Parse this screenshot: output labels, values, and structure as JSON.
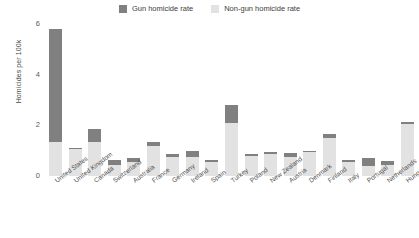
{
  "chart_data": {
    "type": "bar",
    "title": "",
    "subtitle": "",
    "xlabel": "",
    "ylabel": "Homicides per 100k",
    "ylim": [
      0,
      6
    ],
    "yticks": [
      0,
      2,
      4,
      6
    ],
    "grid": false,
    "stacked": true,
    "legend_position": "top-center",
    "categories": [
      "United States",
      "United Kingdom",
      "Canada",
      "Switzerland",
      "Australia",
      "France",
      "Germany",
      "Ireland",
      "Spain",
      "Turkey",
      "Poland",
      "New Zealand",
      "Austria",
      "Denmark",
      "Finland",
      "Italy",
      "Portugal",
      "Netherlands",
      "Hungary"
    ],
    "series": [
      {
        "name": "Gun homicide rate",
        "color": "#808080",
        "values": [
          4.45,
          0.05,
          0.5,
          0.2,
          0.15,
          0.15,
          0.1,
          0.25,
          0.1,
          0.7,
          0.05,
          0.1,
          0.15,
          0.05,
          0.15,
          0.1,
          0.3,
          0.15,
          0.1
        ]
      },
      {
        "name": "Non-gun homicide rate",
        "color": "#e2e2e2",
        "values": [
          1.35,
          1.05,
          1.35,
          0.45,
          0.55,
          1.2,
          0.75,
          0.75,
          0.55,
          2.1,
          0.8,
          0.85,
          0.75,
          0.95,
          1.5,
          0.55,
          0.4,
          0.45,
          2.05
        ]
      }
    ],
    "totals": [
      5.8,
      1.1,
      1.85,
      0.65,
      0.7,
      1.35,
      0.85,
      1.0,
      0.65,
      2.8,
      0.85,
      0.95,
      0.9,
      1.0,
      1.65,
      0.65,
      0.7,
      0.6,
      2.15
    ]
  },
  "legend": {
    "entries": [
      {
        "label": "Gun homicide rate",
        "color": "#808080"
      },
      {
        "label": "Non-gun homicide rate",
        "color": "#e2e2e2"
      }
    ]
  },
  "axis": {
    "y_title": "Homicides per 100k",
    "y_ticks": [
      "0",
      "2",
      "4",
      "6"
    ]
  }
}
